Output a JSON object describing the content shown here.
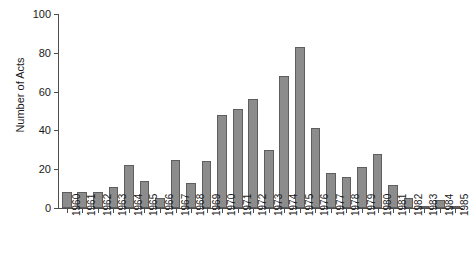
{
  "chart_data": {
    "type": "bar",
    "title": "",
    "xlabel": "",
    "ylabel": "Number of Acts",
    "ylim": [
      0,
      100
    ],
    "yticks": [
      0,
      20,
      40,
      60,
      80,
      100
    ],
    "ytick_labels": [
      "0",
      "20",
      "40",
      "60",
      "80",
      "100"
    ],
    "grid": false,
    "legend": null,
    "bar_color": "#8c8c8c",
    "bar_edge_color": "#5e5e5e",
    "axis_color": "#4d4d4d",
    "categories": [
      "1960",
      "1961",
      "1962",
      "1963",
      "1964",
      "1965",
      "1966",
      "1967",
      "1968",
      "1969",
      "1970",
      "1971",
      "1972",
      "1973",
      "1974",
      "1975",
      "1976",
      "1977",
      "1978",
      "1979",
      "1980",
      "1981",
      "1982",
      "1983",
      "1984",
      "1985"
    ],
    "values": [
      8,
      8,
      8,
      11,
      22,
      14,
      5,
      25,
      13,
      24,
      48,
      51,
      56,
      30,
      68,
      83,
      41,
      18,
      16,
      21,
      28,
      12,
      5,
      1,
      4,
      1
    ]
  }
}
